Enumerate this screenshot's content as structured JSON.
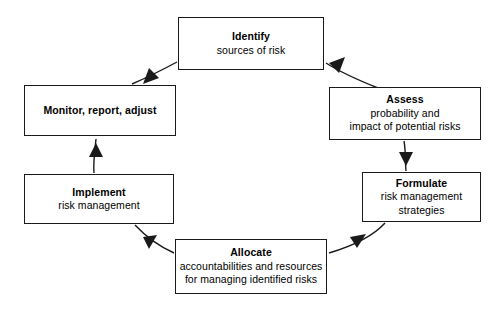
{
  "diagram": {
    "type": "cycle-flow",
    "stroke_color": "#1a1a1a",
    "background_color": "#ffffff",
    "nodes": [
      {
        "id": "identify",
        "title": "Identify",
        "line2": "sources of risk",
        "line3": ""
      },
      {
        "id": "assess",
        "title": "Assess",
        "line2": "probability and",
        "line3": "impact of potential risks"
      },
      {
        "id": "formulate",
        "title": "Formulate",
        "line2": "risk management",
        "line3": "strategies"
      },
      {
        "id": "allocate",
        "title": "Allocate",
        "line2": "accountabilities and resources",
        "line3": "for managing identified risks"
      },
      {
        "id": "implement",
        "title": "Implement",
        "line2": "risk management",
        "line3": ""
      },
      {
        "id": "monitor",
        "title": "Monitor, report, adjust",
        "line2": "",
        "line3": ""
      }
    ],
    "connectors": [
      {
        "id": "identify-to-assess",
        "from": "Identify",
        "to": "Assess",
        "shape": "curve-down-right"
      },
      {
        "id": "assess-to-formulate",
        "from": "Assess",
        "to": "Formulate",
        "shape": "straight-down"
      },
      {
        "id": "formulate-to-allocate",
        "from": "Formulate",
        "to": "Allocate",
        "shape": "curve-down-left"
      },
      {
        "id": "allocate-to-implement",
        "from": "Allocate",
        "to": "Implement",
        "shape": "curve-up-left"
      },
      {
        "id": "implement-to-monitor",
        "from": "Implement",
        "to": "Monitor",
        "shape": "straight-up"
      },
      {
        "id": "monitor-to-identify",
        "from": "Monitor",
        "to": "Identify",
        "shape": "curve-up-right"
      }
    ]
  }
}
